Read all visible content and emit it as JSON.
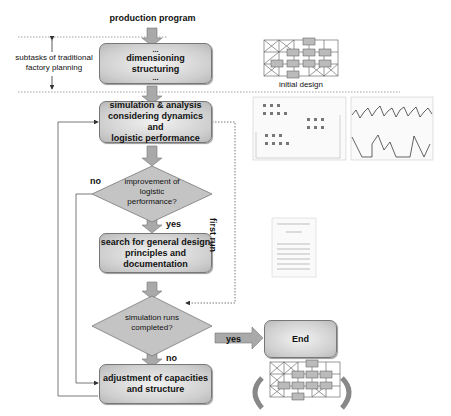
{
  "top": {
    "input_label": "production program",
    "subtasks_label": "subtasks of traditional factory planning",
    "subtasks_line1": "subtasks of traditional",
    "subtasks_line2": "factory planning"
  },
  "boxes": {
    "dimensioning": {
      "dots_top": "...",
      "line1": "dimensioning",
      "line2": "structuring",
      "dots_bottom": "..."
    },
    "simulation": {
      "line1": "simulation & analysis",
      "line2": "considering dynamics and",
      "line3": "logistic performance"
    },
    "search": {
      "line1": "search for general design",
      "line2": "principles and documentation"
    },
    "adjustment": {
      "line1": "adjustment of capacities",
      "line2": "and structure"
    },
    "end": {
      "label": "End"
    }
  },
  "decisions": {
    "improvement": {
      "line1": "improvement of",
      "line2": "logistic",
      "line3": "performance?",
      "yes": "yes",
      "no": "no"
    },
    "runs_completed": {
      "line1": "simulation runs",
      "line2": "completed?",
      "yes": "yes",
      "no": "no"
    }
  },
  "side": {
    "first_run_label": "first run",
    "initial_design_caption": "initial design"
  },
  "illustrations": [
    {
      "name": "initial-layout-grid"
    },
    {
      "name": "simulation-model-screenshot"
    },
    {
      "name": "logistic-performance-plot"
    },
    {
      "name": "documentation-page"
    },
    {
      "name": "adjusted-layout-grid"
    }
  ],
  "colors": {
    "box_fill": "#cfcfcf",
    "arrow_fill": "#a9a9a9",
    "line": "#555555"
  }
}
